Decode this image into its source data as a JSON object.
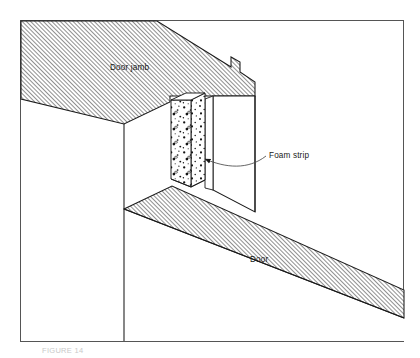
{
  "figure": {
    "kind": "isometric-technical-illustration",
    "frame": {
      "stroke_color": "#555555",
      "fill_color": "#ffffff",
      "x": 20,
      "y": 20,
      "width": 384,
      "height": 322
    },
    "palette": {
      "line": "#1a1a1a",
      "hatch": "#4a4a4a",
      "background": "#ffffff",
      "foam_speckle": "#111111",
      "leader": "#4a4a4a",
      "caption": "#c9c9c9"
    },
    "labels": [
      {
        "id": "door-jamb",
        "text": "Door jamb",
        "x": 110,
        "y": 70,
        "anchor": "start"
      },
      {
        "id": "foam-strip",
        "text": "Foam strip",
        "x": 269,
        "y": 158,
        "anchor": "start"
      },
      {
        "id": "door",
        "text": "Door",
        "x": 250,
        "y": 262,
        "anchor": "start"
      }
    ],
    "caption": {
      "text": "FIGURE 14",
      "x": 42,
      "y": 353
    },
    "leader": {
      "id": "foam-strip-leader",
      "description": "curved leader line from Foam strip label to arrowhead on foam strip",
      "path": "M 266 156 C 248 170, 226 168, 205 159",
      "arrow_tip_x": 199,
      "arrow_tip_y": 157
    },
    "parts": [
      {
        "id": "jamb-top-face",
        "name": "Door jamb top face",
        "hatched": true
      },
      {
        "id": "jamb-front-face",
        "name": "Door jamb front face",
        "hatched": false
      },
      {
        "id": "jamb-right-face",
        "name": "Door jamb right return face",
        "hatched": false
      },
      {
        "id": "foam-strip-front",
        "name": "Foam strip front face",
        "hatched": false,
        "texture": "speckle"
      },
      {
        "id": "foam-strip-side",
        "name": "Foam strip side face",
        "hatched": false,
        "texture": "speckle"
      },
      {
        "id": "door-top-face",
        "name": "Door top face",
        "hatched": true
      },
      {
        "id": "door-edge-face",
        "name": "Door leading edge face",
        "hatched": false
      },
      {
        "id": "wall-face",
        "name": "Wall / opening face",
        "hatched": false
      }
    ]
  }
}
